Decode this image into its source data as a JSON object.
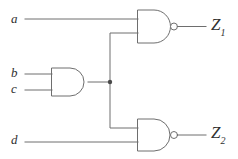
{
  "diagram": {
    "stroke_color": "#6e6e6e",
    "label_color": "#303030",
    "background": "#ffffff",
    "inputs": [
      {
        "id": "a",
        "label": "a",
        "x": 13,
        "y": 13,
        "wire_y": 19
      },
      {
        "id": "b",
        "label": "b",
        "x": 13,
        "y": 67,
        "wire_y": 74
      },
      {
        "id": "c",
        "label": "c",
        "x": 13,
        "y": 83,
        "wire_y": 90
      },
      {
        "id": "d",
        "label": "d",
        "x": 13,
        "y": 132,
        "wire_y": 142
      }
    ],
    "outputs": [
      {
        "id": "z1",
        "label": "Z",
        "subscript": "1",
        "x": 212,
        "y": 18,
        "wire_y": 26
      },
      {
        "id": "z2",
        "label": "Z",
        "subscript": "2",
        "x": 212,
        "y": 126,
        "wire_y": 135
      }
    ],
    "gates": [
      {
        "id": "nand-top",
        "type": "NAND",
        "output_signal": "Z1",
        "body_x": 138,
        "body_y": 10,
        "body_w": 32,
        "body_h": 33,
        "bubble_cx": 174,
        "bubble_cy": 26,
        "bubble_r": 3.5,
        "input_ys": [
          19,
          33
        ],
        "output_y": 26
      },
      {
        "id": "and-mid",
        "type": "AND",
        "output_signal": "bc",
        "body_x": 52,
        "body_y": 68,
        "body_w": 36,
        "body_h": 28,
        "input_ys": [
          74,
          90
        ],
        "output_y": 82
      },
      {
        "id": "nand-bottom",
        "type": "NAND",
        "output_signal": "Z2",
        "body_x": 138,
        "body_y": 119,
        "body_w": 32,
        "body_h": 32,
        "bubble_cx": 174,
        "bubble_cy": 135,
        "bubble_r": 3.5,
        "input_ys": [
          128,
          142
        ],
        "output_y": 135
      }
    ],
    "junction": {
      "id": "fanout-node",
      "x": 110,
      "y": 82,
      "r": 2.2
    },
    "wires": [
      {
        "id": "wire-a",
        "from": "a",
        "to": "nand-top.in0",
        "path": "M25,19 L138,19"
      },
      {
        "id": "wire-b",
        "from": "b",
        "to": "and-mid.in0",
        "path": "M25,74 L52,74"
      },
      {
        "id": "wire-c",
        "from": "c",
        "to": "and-mid.in1",
        "path": "M25,90 L52,90"
      },
      {
        "id": "wire-and-out",
        "from": "and-mid.out",
        "to": "fanout-node",
        "path": "M88,82 L110,82"
      },
      {
        "id": "wire-fanout-up",
        "from": "fanout-node",
        "to": "nand-top.in1",
        "path": "M110,82 L110,33 L138,33"
      },
      {
        "id": "wire-fanout-down",
        "from": "fanout-node",
        "to": "nand-bottom.in0",
        "path": "M110,82 L110,128 L138,128"
      },
      {
        "id": "wire-d",
        "from": "d",
        "to": "nand-bottom.in1",
        "path": "M25,142 L138,142"
      },
      {
        "id": "wire-z1",
        "from": "nand-top.out",
        "to": "Z1",
        "path": "M178,26 L206,26"
      },
      {
        "id": "wire-z2",
        "from": "nand-bottom.out",
        "to": "Z2",
        "path": "M178,135 L206,135"
      }
    ]
  }
}
